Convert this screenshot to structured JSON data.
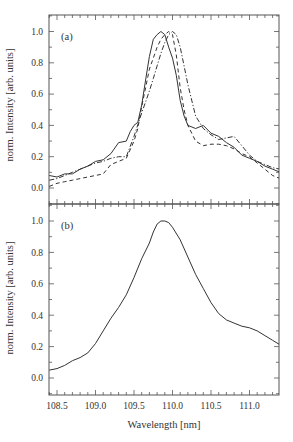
{
  "chart_data": [
    {
      "panel": "(a)",
      "type": "line",
      "xlabel": "Wavelength [nm]",
      "ylabel": "norm. Intensity [arb. units]",
      "xlim": [
        108.4,
        111.4
      ],
      "ylim": [
        -0.1,
        1.1
      ],
      "xticks": [
        108.5,
        109.0,
        109.5,
        110.0,
        110.5,
        111.0
      ],
      "yticks": [
        0.0,
        0.2,
        0.4,
        0.6,
        0.8,
        1.0
      ],
      "grid": false,
      "legend": null,
      "series": [
        {
          "name": "solid",
          "style": "solid",
          "x": [
            108.4,
            108.5,
            108.6,
            108.7,
            108.8,
            108.9,
            109.0,
            109.1,
            109.2,
            109.3,
            109.4,
            109.45,
            109.5,
            109.55,
            109.6,
            109.65,
            109.7,
            109.75,
            109.8,
            109.85,
            109.9,
            109.95,
            110.0,
            110.05,
            110.1,
            110.15,
            110.2,
            110.3,
            110.4,
            110.5,
            110.6,
            110.7,
            110.8,
            110.9,
            111.0,
            111.1,
            111.2,
            111.3,
            111.4
          ],
          "y": [
            0.08,
            0.07,
            0.09,
            0.09,
            0.12,
            0.14,
            0.17,
            0.18,
            0.22,
            0.29,
            0.3,
            0.36,
            0.4,
            0.42,
            0.53,
            0.69,
            0.84,
            0.95,
            0.98,
            1.0,
            0.98,
            0.9,
            0.83,
            0.72,
            0.56,
            0.46,
            0.4,
            0.38,
            0.4,
            0.35,
            0.33,
            0.29,
            0.26,
            0.21,
            0.19,
            0.17,
            0.14,
            0.12,
            0.1
          ]
        },
        {
          "name": "dashed",
          "style": "dashed",
          "x": [
            108.4,
            108.5,
            108.6,
            108.7,
            108.8,
            108.9,
            109.0,
            109.1,
            109.2,
            109.3,
            109.4,
            109.5,
            109.55,
            109.6,
            109.65,
            109.7,
            109.75,
            109.8,
            109.85,
            109.9,
            109.95,
            110.0,
            110.05,
            110.1,
            110.15,
            110.2,
            110.3,
            110.4,
            110.5,
            110.6,
            110.7,
            110.8,
            110.9,
            111.0,
            111.1,
            111.2,
            111.3,
            111.4
          ],
          "y": [
            0.01,
            0.03,
            0.04,
            0.05,
            0.06,
            0.07,
            0.08,
            0.09,
            0.15,
            0.17,
            0.19,
            0.3,
            0.38,
            0.52,
            0.64,
            0.76,
            0.83,
            0.9,
            0.95,
            0.98,
            1.0,
            0.98,
            0.85,
            0.64,
            0.5,
            0.4,
            0.3,
            0.27,
            0.28,
            0.28,
            0.27,
            0.25,
            0.22,
            0.2,
            0.16,
            0.12,
            0.08,
            0.06
          ]
        },
        {
          "name": "dash-dot",
          "style": "dash-dot",
          "x": [
            108.4,
            108.5,
            108.6,
            108.7,
            108.8,
            108.9,
            109.0,
            109.1,
            109.2,
            109.3,
            109.4,
            109.5,
            109.6,
            109.65,
            109.7,
            109.75,
            109.8,
            109.85,
            109.9,
            109.95,
            110.0,
            110.05,
            110.1,
            110.15,
            110.2,
            110.3,
            110.4,
            110.5,
            110.6,
            110.7,
            110.8,
            110.9,
            111.0,
            111.1,
            111.2,
            111.3,
            111.4
          ],
          "y": [
            0.05,
            0.06,
            0.08,
            0.1,
            0.12,
            0.14,
            0.16,
            0.17,
            0.19,
            0.2,
            0.2,
            0.33,
            0.48,
            0.55,
            0.62,
            0.7,
            0.78,
            0.86,
            0.93,
            0.98,
            1.0,
            0.98,
            0.9,
            0.78,
            0.66,
            0.46,
            0.38,
            0.34,
            0.31,
            0.32,
            0.33,
            0.27,
            0.21,
            0.17,
            0.15,
            0.13,
            0.12
          ]
        }
      ]
    },
    {
      "panel": "(b)",
      "type": "line",
      "xlabel": "Wavelength [nm]",
      "ylabel": "norm. Intensity [arb. units]",
      "xlim": [
        108.4,
        111.4
      ],
      "ylim": [
        -0.11,
        1.1
      ],
      "xticks": [
        108.5,
        109.0,
        109.5,
        110.0,
        110.5,
        111.0
      ],
      "yticks": [
        0.0,
        0.2,
        0.4,
        0.6,
        0.8,
        1.0
      ],
      "grid": false,
      "legend": null,
      "series": [
        {
          "name": "solid",
          "style": "solid",
          "x": [
            108.4,
            108.5,
            108.6,
            108.7,
            108.8,
            108.9,
            109.0,
            109.1,
            109.2,
            109.3,
            109.4,
            109.5,
            109.6,
            109.7,
            109.75,
            109.8,
            109.85,
            109.9,
            109.95,
            110.0,
            110.1,
            110.2,
            110.3,
            110.4,
            110.5,
            110.6,
            110.7,
            110.8,
            110.9,
            111.0,
            111.1,
            111.2,
            111.3,
            111.4
          ],
          "y": [
            0.05,
            0.06,
            0.08,
            0.11,
            0.13,
            0.16,
            0.22,
            0.3,
            0.38,
            0.45,
            0.53,
            0.64,
            0.76,
            0.86,
            0.93,
            0.98,
            1.0,
            1.0,
            0.99,
            0.96,
            0.88,
            0.77,
            0.66,
            0.57,
            0.48,
            0.41,
            0.37,
            0.35,
            0.33,
            0.32,
            0.3,
            0.27,
            0.24,
            0.21
          ]
        }
      ]
    }
  ],
  "figure": {
    "panels": [
      "(a)",
      "(b)"
    ],
    "xlabel": "Wavelength [nm]",
    "ylabel_a": "norm. Intensity [arb. units]",
    "ylabel_b": "norm. Intensity [arb. units]",
    "xtick_labels": [
      "108.5",
      "109.0",
      "109.5",
      "110.0",
      "110.5",
      "111.0"
    ],
    "ytick_labels": [
      "0.0",
      "0.2",
      "0.4",
      "0.6",
      "0.8",
      "1.0"
    ],
    "line_color": "#333333",
    "frame_color": "#555555"
  }
}
